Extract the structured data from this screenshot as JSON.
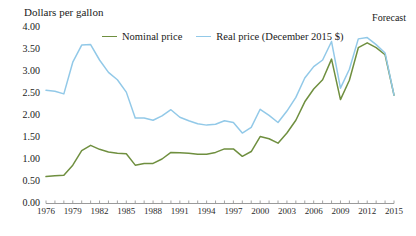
{
  "chart_data": {
    "type": "line",
    "title": "",
    "ylabel": "Dollars per gallon",
    "xlabel": "",
    "ylim": [
      0,
      4.0
    ],
    "ytick_labels": [
      "4.00",
      "3.50",
      "3.00",
      "2.50",
      "2.00",
      "1.50",
      "1.00",
      "0.50",
      "0.00"
    ],
    "ytick_values": [
      4.0,
      3.5,
      3.0,
      2.5,
      2.0,
      1.5,
      1.0,
      0.5,
      0.0
    ],
    "grid": false,
    "legend_position": "top-center",
    "annotations": [
      {
        "text": "Forecast",
        "position": "top-right"
      }
    ],
    "x": [
      1976,
      1977,
      1978,
      1979,
      1980,
      1981,
      1982,
      1983,
      1984,
      1985,
      1986,
      1987,
      1988,
      1989,
      1990,
      1991,
      1992,
      1993,
      1994,
      1995,
      1996,
      1997,
      1998,
      1999,
      2000,
      2001,
      2002,
      2003,
      2004,
      2005,
      2006,
      2007,
      2008,
      2009,
      2010,
      2011,
      2012,
      2013,
      2014,
      2015
    ],
    "xtick_labels": [
      "1976",
      "1979",
      "1982",
      "1985",
      "1988",
      "1991",
      "1994",
      "1997",
      "2000",
      "2003",
      "2006",
      "2009",
      "2012",
      "2015"
    ],
    "xtick_values": [
      1976,
      1979,
      1982,
      1985,
      1988,
      1991,
      1994,
      1997,
      2000,
      2003,
      2006,
      2009,
      2012,
      2015
    ],
    "xlim": [
      1976,
      2015
    ],
    "series": [
      {
        "name": "Nominal price",
        "color": "#6f8f3f",
        "values": [
          0.6,
          0.62,
          0.63,
          0.86,
          1.19,
          1.31,
          1.22,
          1.16,
          1.13,
          1.12,
          0.86,
          0.9,
          0.9,
          1.0,
          1.15,
          1.14,
          1.13,
          1.11,
          1.11,
          1.15,
          1.23,
          1.23,
          1.06,
          1.17,
          1.51,
          1.46,
          1.36,
          1.59,
          1.88,
          2.3,
          2.59,
          2.8,
          3.27,
          2.35,
          2.79,
          3.53,
          3.64,
          3.53,
          3.37,
          2.45
        ]
      },
      {
        "name": "Real price (December 2015 $)",
        "color": "#92c9e8",
        "values": [
          2.56,
          2.54,
          2.48,
          3.2,
          3.59,
          3.6,
          3.25,
          2.97,
          2.8,
          2.52,
          1.93,
          1.93,
          1.88,
          1.98,
          2.12,
          1.95,
          1.87,
          1.8,
          1.77,
          1.79,
          1.87,
          1.83,
          1.59,
          1.72,
          2.13,
          1.99,
          1.83,
          2.09,
          2.4,
          2.84,
          3.1,
          3.25,
          3.67,
          2.61,
          3.04,
          3.73,
          3.76,
          3.6,
          3.41,
          2.45
        ]
      }
    ]
  }
}
